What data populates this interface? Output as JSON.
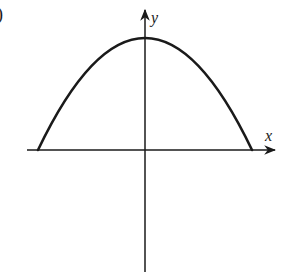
{
  "figure": {
    "fragment_label": ")",
    "x_axis": {
      "label": "x"
    },
    "y_axis": {
      "label": "y"
    },
    "curve": {
      "type": "parabola",
      "opens": "down",
      "vertex_on_y_axis": true,
      "roots": "symmetric, on x-axis"
    },
    "colors": {
      "stroke": "#1a1a1a",
      "background": "#ffffff"
    }
  }
}
